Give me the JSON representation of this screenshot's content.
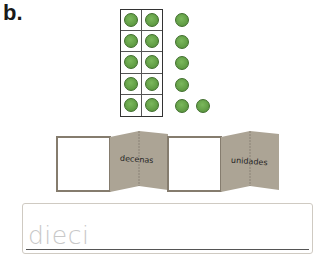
{
  "exercise_label": "b.",
  "ten_frame": {
    "rows": 5,
    "columns": 2,
    "filled": 10,
    "dot_color": "#6aa84f"
  },
  "loose_dots": {
    "count": 6,
    "arrangement": "column of 5 plus 1 to the right of the bottom"
  },
  "place_value": {
    "tens_box_value": "",
    "tens_label": "decenas",
    "ones_box_value": "",
    "ones_label": "unidades",
    "panel_color": "#aca495"
  },
  "answer": {
    "prefilled_text": "dieci"
  }
}
